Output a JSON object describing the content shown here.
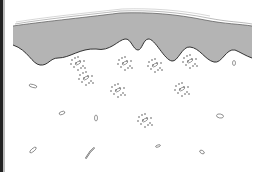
{
  "figure": {
    "colors": {
      "background": "#ffffff",
      "epidermis_fill": "#b4b4b4",
      "outline": "#333333",
      "left_bar": "#222222"
    },
    "clusters": [
      {
        "x": 78,
        "y": 63
      },
      {
        "x": 86,
        "y": 78
      },
      {
        "x": 125,
        "y": 63
      },
      {
        "x": 155,
        "y": 65
      },
      {
        "x": 190,
        "y": 61
      },
      {
        "x": 118,
        "y": 90
      },
      {
        "x": 182,
        "y": 89
      },
      {
        "x": 145,
        "y": 120
      }
    ],
    "cells": [
      {
        "x": 33,
        "y": 86,
        "w": 8,
        "h": 3,
        "r": 15
      },
      {
        "x": 62,
        "y": 113,
        "w": 6,
        "h": 3,
        "r": -20
      },
      {
        "x": 96,
        "y": 118,
        "w": 3,
        "h": 6,
        "r": 0
      },
      {
        "x": 234,
        "y": 63,
        "w": 3,
        "h": 5,
        "r": 0
      },
      {
        "x": 220,
        "y": 116,
        "w": 7,
        "h": 4,
        "r": 10
      },
      {
        "x": 33,
        "y": 150,
        "w": 8,
        "h": 3,
        "r": -40
      },
      {
        "x": 158,
        "y": 146,
        "w": 5,
        "h": 2,
        "r": -20
      },
      {
        "x": 202,
        "y": 152,
        "w": 5,
        "h": 3,
        "r": 30
      }
    ]
  }
}
